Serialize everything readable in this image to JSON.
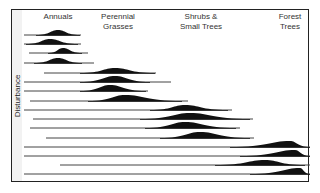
{
  "y_axis_label": "Disturbance",
  "columns": [
    {
      "label": "Annuals",
      "x": 58,
      "y": 12
    },
    {
      "label": "Perennial\nGrasses",
      "x": 118,
      "y": 12
    },
    {
      "label": "Shrubs &\nSmall Trees",
      "x": 201,
      "y": 12
    },
    {
      "label": "Forest\nTrees",
      "x": 290,
      "y": 12
    }
  ],
  "rows": [
    {
      "y": 35,
      "x1": 24,
      "x2": 81,
      "h1": 36,
      "peak": 58,
      "h2": 80,
      "height": 5
    },
    {
      "y": 44,
      "x1": 24,
      "x2": 81,
      "h1": 26,
      "peak": 50,
      "h2": 78,
      "height": 5
    },
    {
      "y": 53,
      "x1": 29,
      "x2": 88,
      "h1": 48,
      "peak": 63,
      "h2": 82,
      "height": 5
    },
    {
      "y": 63,
      "x1": 24,
      "x2": 94,
      "h1": 34,
      "peak": 58,
      "h2": 82,
      "height": 5
    },
    {
      "y": 73,
      "x1": 44,
      "x2": 156,
      "h1": 80,
      "peak": 115,
      "h2": 155,
      "height": 5
    },
    {
      "y": 82,
      "x1": 24,
      "x2": 171,
      "h1": 80,
      "peak": 115,
      "h2": 150,
      "height": 6
    },
    {
      "y": 91,
      "x1": 24,
      "x2": 148,
      "h1": 80,
      "peak": 110,
      "h2": 146,
      "height": 6
    },
    {
      "y": 101,
      "x1": 30,
      "x2": 188,
      "h1": 88,
      "peak": 125,
      "h2": 182,
      "height": 6
    },
    {
      "y": 110,
      "x1": 24,
      "x2": 232,
      "h1": 150,
      "peak": 185,
      "h2": 228,
      "height": 5
    },
    {
      "y": 119,
      "x1": 33,
      "x2": 253,
      "h1": 140,
      "peak": 190,
      "h2": 250,
      "height": 6
    },
    {
      "y": 128,
      "x1": 30,
      "x2": 240,
      "h1": 145,
      "peak": 185,
      "h2": 236,
      "height": 6
    },
    {
      "y": 138,
      "x1": 46,
      "x2": 254,
      "h1": 160,
      "peak": 200,
      "h2": 250,
      "height": 6
    },
    {
      "y": 147,
      "x1": 24,
      "x2": 310,
      "h1": 230,
      "peak": 290,
      "h2": 310,
      "height": 6
    },
    {
      "y": 156,
      "x1": 24,
      "x2": 310,
      "h1": 240,
      "peak": 295,
      "h2": 310,
      "height": 6
    },
    {
      "y": 165,
      "x1": 60,
      "x2": 310,
      "h1": 215,
      "peak": 265,
      "h2": 305,
      "height": 5
    },
    {
      "y": 174,
      "x1": 24,
      "x2": 310,
      "h1": 250,
      "peak": 300,
      "h2": 310,
      "height": 6
    }
  ]
}
